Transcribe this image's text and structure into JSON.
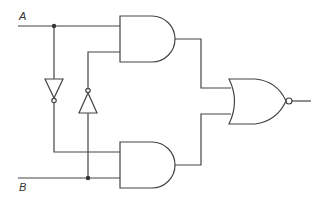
{
  "diagram": {
    "type": "logic-circuit",
    "inputs": [
      {
        "id": "A",
        "label": "A"
      },
      {
        "id": "B",
        "label": "B"
      }
    ],
    "gates": [
      {
        "id": "not1",
        "type": "NOT",
        "input": "A",
        "orientation": "down"
      },
      {
        "id": "not2",
        "type": "NOT",
        "input": "B",
        "orientation": "up"
      },
      {
        "id": "and1",
        "type": "AND",
        "inputs": [
          "A",
          "not2"
        ]
      },
      {
        "id": "and2",
        "type": "AND",
        "inputs": [
          "not1",
          "B"
        ]
      },
      {
        "id": "nor1",
        "type": "NOR",
        "inputs": [
          "and1",
          "and2"
        ]
      }
    ],
    "output": "nor1",
    "colors": {
      "stroke": "#444444",
      "background": "#ffffff"
    }
  }
}
